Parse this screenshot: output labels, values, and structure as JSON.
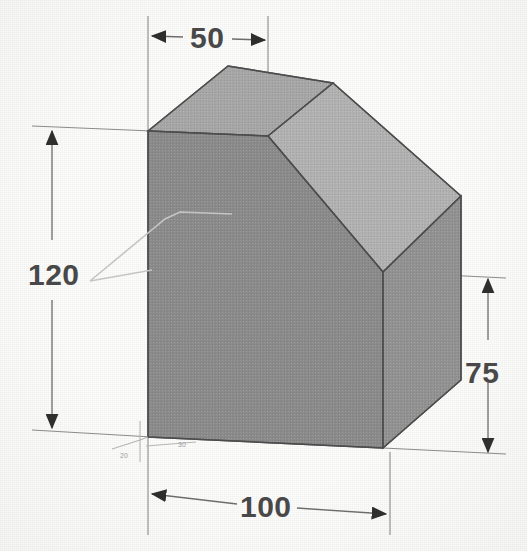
{
  "figure": {
    "kind": "isometric-technical-drawing",
    "background_color": "#fdfdfc",
    "line_color": "#5a5a5a"
  },
  "solid": {
    "faces": [
      {
        "name": "front-face",
        "shade": "#8d8d8d"
      },
      {
        "name": "top-face",
        "shade": "#a9a9a9"
      },
      {
        "name": "chamfer-face",
        "shade": "#b4b4b4"
      },
      {
        "name": "right-face",
        "shade": "#949494"
      }
    ]
  },
  "dimensions": [
    {
      "id": "width-top",
      "value": "50",
      "orientation": "horizontal",
      "position": "top",
      "arrows": "outward"
    },
    {
      "id": "height-left",
      "value": "120",
      "orientation": "vertical",
      "position": "left",
      "arrows": "outward"
    },
    {
      "id": "height-right",
      "value": "75",
      "orientation": "vertical",
      "position": "right",
      "arrows": "outward"
    },
    {
      "id": "width-bottom",
      "value": "100",
      "orientation": "horizontal",
      "position": "bottom",
      "arrows": "outward"
    }
  ],
  "annotations": {
    "micro_label_left": "20",
    "micro_label_right": "30"
  }
}
